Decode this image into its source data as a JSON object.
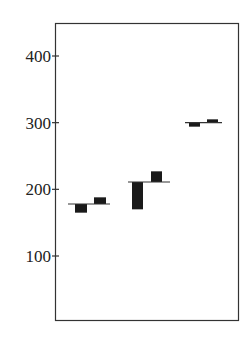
{
  "chart_data": {
    "type": "bar",
    "subtype": "deviation-bars-from-reference-line",
    "title": "",
    "xlabel": "",
    "ylabel": "",
    "ylim": [
      0,
      450
    ],
    "yticks": [
      100,
      200,
      300,
      400
    ],
    "ytick_labels": [
      "100",
      "200",
      "300",
      "400"
    ],
    "grid": false,
    "legend": null,
    "groups": [
      {
        "reference": 178,
        "bars": [
          {
            "from": 178,
            "to": 165
          },
          {
            "from": 178,
            "to": 188
          }
        ]
      },
      {
        "reference": 211,
        "bars": [
          {
            "from": 211,
            "to": 170
          },
          {
            "from": 211,
            "to": 227
          }
        ]
      },
      {
        "reference": 300,
        "bars": [
          {
            "from": 300,
            "to": 294
          },
          {
            "from": 300,
            "to": 305
          }
        ]
      }
    ],
    "colors": {
      "bar": "#1a1a1a",
      "axis": "#333333",
      "reference_line": "#333333"
    }
  },
  "axis": {
    "labels": [
      "100",
      "200",
      "300",
      "400"
    ]
  }
}
